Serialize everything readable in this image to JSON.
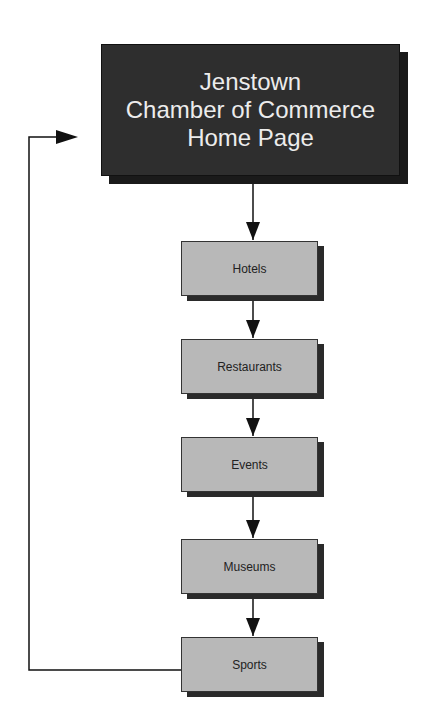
{
  "diagram": {
    "root": {
      "lines": [
        "Jenstown",
        "Chamber of Commerce",
        "Home Page"
      ]
    },
    "nodes": [
      {
        "label": "Hotels",
        "top": 241
      },
      {
        "label": "Restaurants",
        "top": 339
      },
      {
        "label": "Events",
        "top": 437
      },
      {
        "label": "Museums",
        "top": 539
      },
      {
        "label": "Sports",
        "top": 637
      }
    ],
    "colors": {
      "root_fill": "#2e2e2e",
      "root_text": "#ececec",
      "node_fill": "#b8b8b8",
      "line": "#111111"
    }
  }
}
